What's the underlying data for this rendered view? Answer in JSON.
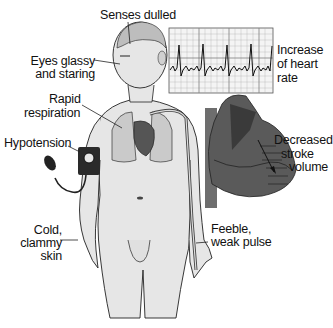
{
  "diagram": {
    "labels": {
      "senses": "Senses dulled",
      "eyes_1": "Eyes glassy",
      "eyes_2": "and staring",
      "resp_1": "Rapid",
      "resp_2": "respiration",
      "hypo": "Hypotension",
      "cold_1": "Cold,",
      "cold_2": "clammy",
      "cold_3": "skin",
      "hr_1": "Increase",
      "hr_2": "of heart",
      "hr_3": "rate",
      "sv_1": "Decreased",
      "sv_2": "stroke",
      "sv_3": "volume",
      "pulse_1": "Feeble,",
      "pulse_2": "weak pulse"
    },
    "panels": {
      "ecg_strip": "ECG rhythm strip showing tachycardia",
      "heart_cutaway": "Heart cross-section with decreased stroke volume",
      "figure": "Human figure with lungs, heart, blood pressure cuff"
    },
    "colors": {
      "skin": "#e4e4e4",
      "outline": "#222222",
      "heart_dark": "#4a4a4a",
      "heart_mid": "#6e6e6e",
      "lungs": "#c9c9c9",
      "brain": "#bdbdbd",
      "grid": "#9a9a9a"
    }
  }
}
